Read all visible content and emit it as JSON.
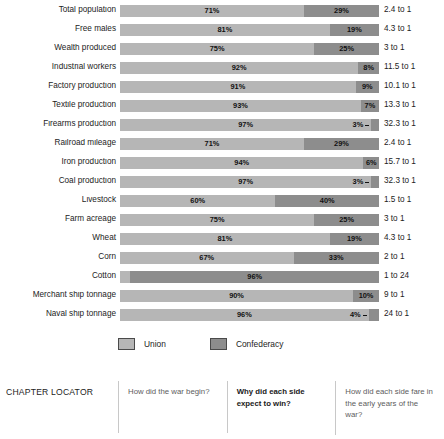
{
  "chart_data": {
    "type": "bar",
    "subtype": "stacked-horizontal-100-percent",
    "title": "",
    "xlabel": "",
    "ylabel": "",
    "xlim": [
      0,
      100
    ],
    "grid": false,
    "legend_position": "bottom",
    "categories": [
      "Total population",
      "Free males",
      "Wealth produced",
      "Industrial workers",
      "Factory production",
      "Textile production",
      "Firearms production",
      "Railroad mileage",
      "Iron production",
      "Coal production",
      "Livestock",
      "Farm acreage",
      "Wheat",
      "Corn",
      "Cotton",
      "Merchant ship tonnage",
      "Naval ship tonnage"
    ],
    "series": [
      {
        "name": "Union",
        "color": "#b6b6b6",
        "values": [
          71,
          81,
          75,
          92,
          91,
          93,
          97,
          71,
          94,
          97,
          60,
          75,
          81,
          67,
          4,
          90,
          96
        ]
      },
      {
        "name": "Confederacy",
        "color": "#8d8d8d",
        "values": [
          29,
          19,
          25,
          8,
          9,
          7,
          3,
          29,
          6,
          3,
          40,
          25,
          19,
          33,
          96,
          10,
          4
        ]
      }
    ],
    "ratios": [
      "2.4 to 1",
      "4.3 to 1",
      "3 to 1",
      "11.5 to 1",
      "10.1 to 1",
      "13.3 to 1",
      "32.3 to 1",
      "2.4 to 1",
      "15.7 to 1",
      "32.3 to 1",
      "1.5 to 1",
      "3 to 1",
      "4.3 to 1",
      "2 to 1",
      "1 to 24",
      "9 to 1",
      "24 to 1"
    ]
  },
  "rows": [
    {
      "label": "Total population",
      "union": 71,
      "conf": 29,
      "union_label": "71%",
      "conf_label": "29%",
      "ratio": "2.4 to 1",
      "inverted": false,
      "tiny": false
    },
    {
      "label": "Free males",
      "union": 81,
      "conf": 19,
      "union_label": "81%",
      "conf_label": "19%",
      "ratio": "4.3 to 1",
      "inverted": false,
      "tiny": false
    },
    {
      "label": "Wealth produced",
      "union": 75,
      "conf": 25,
      "union_label": "75%",
      "conf_label": "25%",
      "ratio": "3 to 1",
      "inverted": false,
      "tiny": false
    },
    {
      "label": "Industrial workers",
      "union": 92,
      "conf": 8,
      "union_label": "92%",
      "conf_label": "8%",
      "ratio": "11.5 to 1",
      "inverted": false,
      "tiny": false
    },
    {
      "label": "Factory production",
      "union": 91,
      "conf": 9,
      "union_label": "91%",
      "conf_label": "9%",
      "ratio": "10.1 to 1",
      "inverted": false,
      "tiny": false
    },
    {
      "label": "Textile production",
      "union": 93,
      "conf": 7,
      "union_label": "93%",
      "conf_label": "7%",
      "ratio": "13.3 to 1",
      "inverted": false,
      "tiny": false
    },
    {
      "label": "Firearms production",
      "union": 97,
      "conf": 3,
      "union_label": "97%",
      "conf_label": "3%",
      "ratio": "32.3 to 1",
      "inverted": false,
      "tiny": true
    },
    {
      "label": "Railroad mileage",
      "union": 71,
      "conf": 29,
      "union_label": "71%",
      "conf_label": "29%",
      "ratio": "2.4 to 1",
      "inverted": false,
      "tiny": false
    },
    {
      "label": "Iron production",
      "union": 94,
      "conf": 6,
      "union_label": "94%",
      "conf_label": "6%",
      "ratio": "15.7 to 1",
      "inverted": false,
      "tiny": false
    },
    {
      "label": "Coal production",
      "union": 97,
      "conf": 3,
      "union_label": "97%",
      "conf_label": "3%",
      "ratio": "32.3 to 1",
      "inverted": false,
      "tiny": true
    },
    {
      "label": "Livestock",
      "union": 60,
      "conf": 40,
      "union_label": "60%",
      "conf_label": "40%",
      "ratio": "1.5 to 1",
      "inverted": false,
      "tiny": false
    },
    {
      "label": "Farm acreage",
      "union": 75,
      "conf": 25,
      "union_label": "75%",
      "conf_label": "25%",
      "ratio": "3 to 1",
      "inverted": false,
      "tiny": false
    },
    {
      "label": "Wheat",
      "union": 81,
      "conf": 19,
      "union_label": "81%",
      "conf_label": "19%",
      "ratio": "4.3 to 1",
      "inverted": false,
      "tiny": false
    },
    {
      "label": "Corn",
      "union": 67,
      "conf": 33,
      "union_label": "67%",
      "conf_label": "33%",
      "ratio": "2 to 1",
      "inverted": false,
      "tiny": false
    },
    {
      "label": "Cotton",
      "union": 4,
      "conf": 96,
      "union_label": "4%",
      "conf_label": "96%",
      "ratio": "1 to 24",
      "inverted": true,
      "tiny": false
    },
    {
      "label": "Merchant ship tonnage",
      "union": 90,
      "conf": 10,
      "union_label": "90%",
      "conf_label": "10%",
      "ratio": "9 to 1",
      "inverted": false,
      "tiny": false
    },
    {
      "label": "Naval ship tonnage",
      "union": 96,
      "conf": 4,
      "union_label": "96%",
      "conf_label": "4%",
      "ratio": "24 to 1",
      "inverted": false,
      "tiny": true
    }
  ],
  "legend": {
    "items": [
      {
        "label": "Union",
        "color": "#b6b6b6"
      },
      {
        "label": "Confederacy",
        "color": "#8d8d8d"
      }
    ]
  },
  "locator": {
    "title": "CHAPTER LOCATOR",
    "questions": [
      {
        "text": "How did the war begin?",
        "active": false
      },
      {
        "text": "Why did each side expect to win?",
        "active": true
      },
      {
        "text": "How did each side fare in the early years of the war?",
        "active": false
      }
    ]
  }
}
